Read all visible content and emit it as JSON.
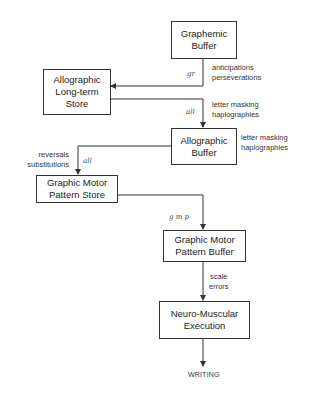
{
  "boxes": {
    "graphemic_buffer": {
      "line1": "Graphemic",
      "line2": "Buffer"
    },
    "allographic_lt_store": {
      "line1": "Allographic",
      "line2": "Long-term",
      "line3": "Store"
    },
    "allographic_buffer": {
      "line1": "Allographic",
      "line2": "Buffer"
    },
    "gmp_store": {
      "line1": "Graphic Motor",
      "line2": "Pattern Store"
    },
    "gmp_buffer": {
      "line1": "Graphic Motor",
      "line2": "Pattern Buffer"
    },
    "neuro_muscular": {
      "line1": "Neuro-Muscular",
      "line2": "Execution"
    }
  },
  "edge_labels": {
    "gr": "gr",
    "all_1": "all",
    "all_2": "all",
    "gmp": "g m p"
  },
  "error_labels": {
    "graphemic": {
      "line1": "anticipations",
      "line2": "perseverations"
    },
    "lt_store": {
      "line1": "letter masking",
      "line2": "haplographies"
    },
    "allo_buffer": {
      "line1": "letter masking",
      "line2": "haplographies"
    },
    "gmp_store": {
      "line1": "reversals",
      "line2": "substitutions"
    },
    "gmp_buffer": {
      "line1": "scale",
      "line2": "errors"
    }
  },
  "output": "WRITING"
}
